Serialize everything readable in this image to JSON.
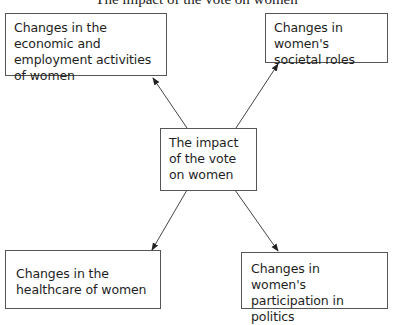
{
  "diagram": {
    "title": "The impact of the vote on women",
    "center": {
      "label": "The impact of the vote on women"
    },
    "nodes": [
      {
        "id": "economic",
        "label": "Changes in the economic and employment activities of women",
        "position": "top-left"
      },
      {
        "id": "societal",
        "label": "Changes in women's societal roles",
        "position": "top-right"
      },
      {
        "id": "healthcare",
        "label": "Changes in the healthcare of women",
        "position": "bottom-left"
      },
      {
        "id": "politics",
        "label": "Changes in women's participation in politics",
        "position": "bottom-right"
      }
    ],
    "edges": [
      {
        "from": "center",
        "to": "economic"
      },
      {
        "from": "center",
        "to": "societal"
      },
      {
        "from": "center",
        "to": "healthcare"
      },
      {
        "from": "center",
        "to": "politics"
      }
    ]
  }
}
